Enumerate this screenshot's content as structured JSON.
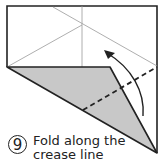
{
  "diagram": {
    "type": "origami-fold-step",
    "step_number": "9",
    "instruction_line1": "Fold along the",
    "instruction_line2": "crease line",
    "colors": {
      "line": "#222222",
      "thin_line": "#999999",
      "shaded_flap": "#c8c8c8",
      "background": "#ffffff"
    },
    "elements": [
      "paper-outline",
      "crease-lines",
      "shaded-flap",
      "dashed-fold-line",
      "curved-fold-arrow"
    ]
  }
}
